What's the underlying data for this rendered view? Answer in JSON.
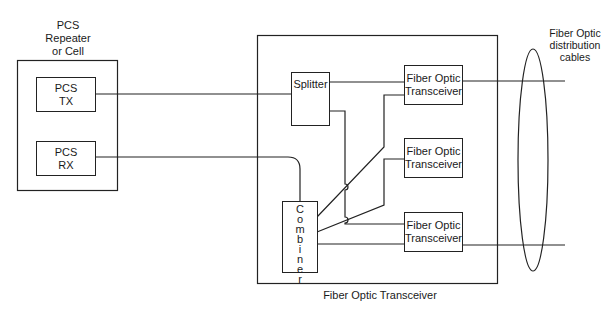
{
  "diagram": {
    "left_unit": {
      "title_lines": [
        "PCS",
        "Repeater",
        "or Cell"
      ]
    },
    "pcs_tx": {
      "lines": [
        "PCS",
        "TX"
      ]
    },
    "pcs_rx": {
      "lines": [
        "PCS",
        "RX"
      ]
    },
    "splitter": {
      "label": "Splitter"
    },
    "combiner": {
      "letters": [
        "C",
        "o",
        "m",
        "b",
        "i",
        "n",
        "e",
        "r"
      ]
    },
    "transceivers": [
      {
        "lines": [
          "Fiber Optic",
          "Transceiver"
        ]
      },
      {
        "lines": [
          "Fiber Optic",
          "Transceiver"
        ]
      },
      {
        "lines": [
          "Fiber Optic",
          "Transceiver"
        ]
      }
    ],
    "main_unit": {
      "caption": "Fiber Optic Transceiver"
    },
    "cables": {
      "title_lines": [
        "Fiber Optic",
        "distribution",
        "cables"
      ]
    },
    "colors": {
      "line": "#222222",
      "background": "#ffffff"
    }
  }
}
